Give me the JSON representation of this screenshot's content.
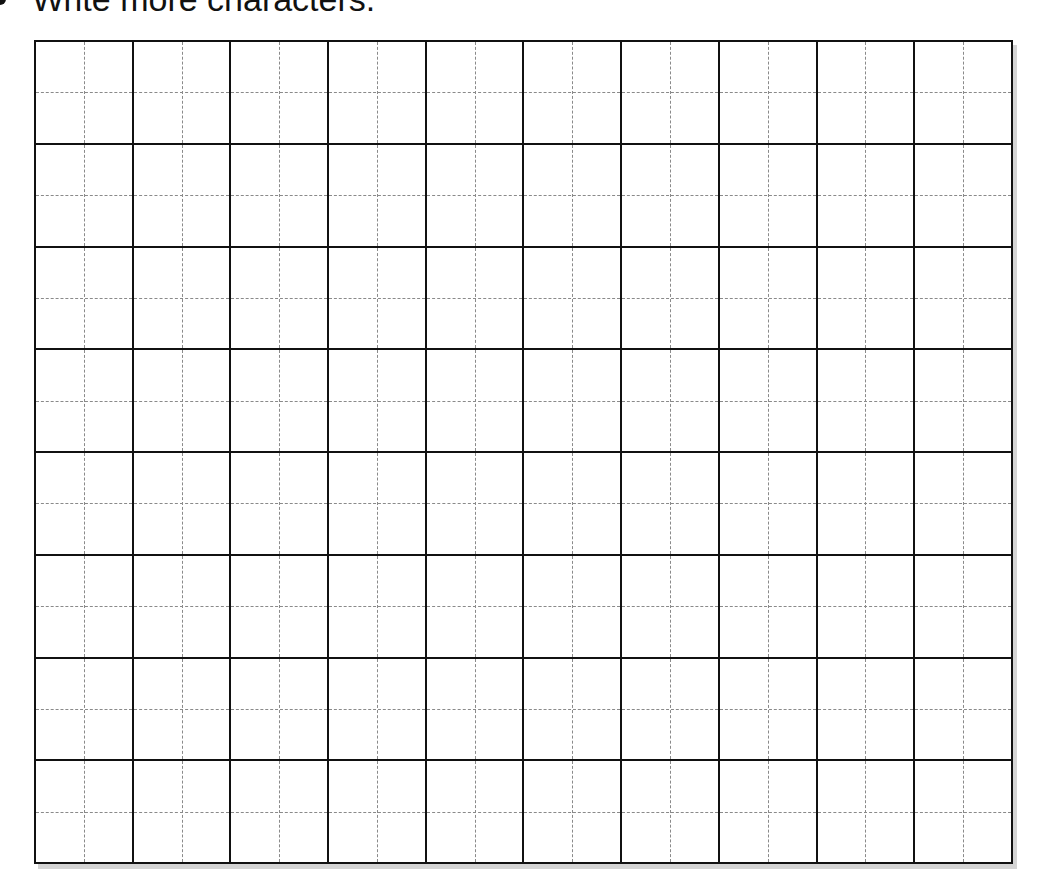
{
  "worksheet": {
    "instruction": "Write more characters.",
    "bullet_icon": "bullet-icon",
    "grid": {
      "rows": 8,
      "columns": 10,
      "cell_style": "tian-zi-ge",
      "cell_guides": [
        "vertical-dashed-midline",
        "horizontal-dashed-midline"
      ],
      "line_color": "#111111",
      "guide_color": "#8a8a8a",
      "shadow_color": "#d4d4d4"
    }
  }
}
